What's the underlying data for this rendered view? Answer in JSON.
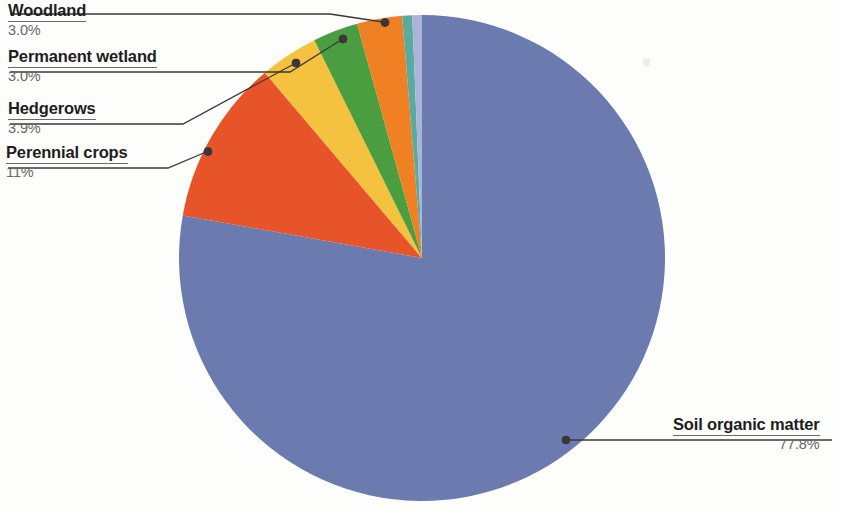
{
  "chart_data": {
    "type": "pie",
    "title": "",
    "subtitle": "",
    "xlabel": "",
    "ylabel": "",
    "legend_position": "callout-labels",
    "grid": false,
    "total_percent": 101.7,
    "start_angle_deg": 0,
    "direction": "clockwise",
    "center": {
      "x": 422,
      "y": 258
    },
    "radius": 243,
    "categories": [
      "Soil organic matter",
      "Perennial crops",
      "Hedgerows",
      "Permanent wetland",
      "Woodland",
      "Slice 6",
      "Slice 7"
    ],
    "values": [
      77.8,
      11,
      3.9,
      3.0,
      3.0,
      1.5,
      1.5
    ],
    "labels": [
      "77.8%",
      "11%",
      "3.9%",
      "3.0%",
      "3.0%",
      "",
      ""
    ],
    "colors": [
      "#6b7bb0",
      "#e8542a",
      "#f5c23f",
      "#4a9e3f",
      "#ef8024",
      "#5aab9e",
      "#a8b4d8"
    ],
    "slices": [
      {
        "name": "soil-organic-matter",
        "label": "Soil organic matter",
        "percent_label": "77.8%",
        "value": 77.8,
        "color": "#6b7bb0",
        "start_deg": 0,
        "end_deg": 280.1
      },
      {
        "name": "perennial-crops",
        "label": "Perennial crops",
        "percent_label": "11%",
        "value": 11,
        "color": "#e8542a",
        "start_deg": 280.1,
        "end_deg": 319.7
      },
      {
        "name": "hedgerows",
        "label": "Hedgerows",
        "percent_label": "3.9%",
        "value": 3.9,
        "color": "#f5c23f",
        "start_deg": 319.7,
        "end_deg": 333.7
      },
      {
        "name": "permanent-wetland",
        "label": "Permanent wetland",
        "percent_label": "3.0%",
        "value": 3.0,
        "color": "#4a9e3f",
        "start_deg": 333.7,
        "end_deg": 344.5
      },
      {
        "name": "woodland",
        "label": "Woodland",
        "percent_label": "3.0%",
        "value": 3.0,
        "color": "#ef8024",
        "start_deg": 344.5,
        "end_deg": 355.3
      },
      {
        "name": "slice-teal",
        "label": "",
        "percent_label": "",
        "value": 1.5,
        "color": "#5aab9e",
        "start_deg": 355.3,
        "end_deg": 357.7
      },
      {
        "name": "slice-periwinkle",
        "label": "",
        "percent_label": "",
        "value": 1.5,
        "color": "#a8b4d8",
        "start_deg": 357.7,
        "end_deg": 360
      }
    ]
  },
  "callouts": {
    "woodland": {
      "label": "Woodland",
      "percent": "3.0%"
    },
    "permanent_wetland": {
      "label": "Permanent wetland",
      "percent": "3.0%"
    },
    "hedgerows": {
      "label": "Hedgerows",
      "percent": "3.9%"
    },
    "perennial_crops": {
      "label": "Perennial crops",
      "percent": "11%"
    },
    "soil_organic_matter": {
      "label": "Soil organic matter",
      "percent": "77.8%"
    }
  }
}
